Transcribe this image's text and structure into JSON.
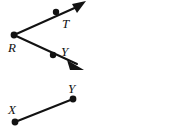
{
  "figure": {
    "background_color": "#ffffff",
    "stroke_color": "#121212",
    "width": 170,
    "height": 129,
    "labels": {
      "vertex_r": "R",
      "point_t": "T",
      "point_y_ray": "Y",
      "point_x": "X",
      "point_y_segment": "Y"
    },
    "points": [
      {
        "name": "R",
        "label": "R",
        "x": 14,
        "y": 35,
        "label_x": 8,
        "label_y": 52
      },
      {
        "name": "T",
        "label": "T",
        "x": 56,
        "y": 12,
        "label_x": 62,
        "label_y": 28
      },
      {
        "name": "Y_ray",
        "label": "Y",
        "x": 53,
        "y": 55,
        "label_x": 60,
        "label_y": 56
      },
      {
        "name": "X",
        "label": "X",
        "x": 15,
        "y": 122,
        "label_x": 8,
        "label_y": 113
      },
      {
        "name": "Y_segment",
        "label": "Y",
        "x": 73,
        "y": 99,
        "label_x": 68,
        "label_y": 92
      }
    ],
    "rays": [
      {
        "name": "ray-RT",
        "from": "R",
        "through": "T",
        "arrow_tip_x": 86,
        "arrow_tip_y": 2
      },
      {
        "name": "ray-RY",
        "from": "R",
        "through": "Y_ray",
        "arrow_tip_x": 84,
        "arrow_tip_y": 70
      }
    ],
    "segments": [
      {
        "name": "segment-XY",
        "from": "X",
        "to": "Y_segment"
      }
    ],
    "dot_radius": 3.2
  }
}
